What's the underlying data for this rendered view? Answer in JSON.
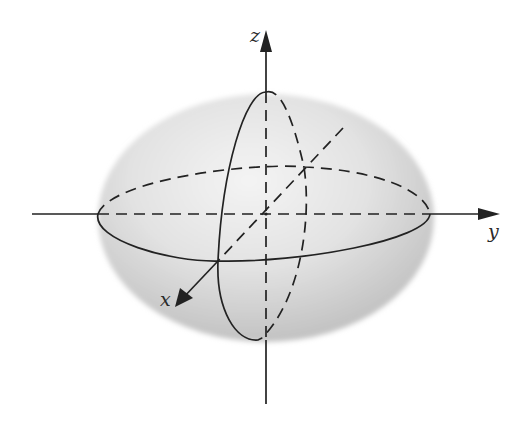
{
  "figure": {
    "axes": {
      "z": {
        "label": "z"
      },
      "y": {
        "label": "y"
      },
      "x": {
        "label": "x"
      }
    },
    "colors": {
      "line": "#222222",
      "shade_light": "#f2f2f2",
      "shade_dark": "#c4c4c4",
      "background": "#ffffff"
    }
  }
}
